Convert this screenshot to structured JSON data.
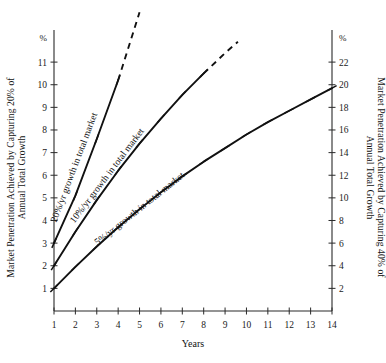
{
  "chart_data": {
    "type": "line",
    "title": "",
    "xlabel": "Years",
    "ylabel": "Market Penetration Achieved by Capturing 20% of Annual Total Growth",
    "ylabel_right": "Market Penetration Achieved by Capturing 40% of Annual Total Growth",
    "y_unit_symbol": "%",
    "x": [
      1,
      2,
      3,
      4,
      5,
      6,
      7,
      8,
      9,
      10,
      11,
      12,
      13,
      14
    ],
    "xlim": [
      1,
      14
    ],
    "xticks": [
      "1",
      "2",
      "3",
      "4",
      "5",
      "6",
      "7",
      "8",
      "9",
      "10",
      "11",
      "12",
      "13",
      "14"
    ],
    "ylim": [
      0,
      11.8
    ],
    "yticks": [
      "1",
      "2",
      "3",
      "4",
      "5",
      "6",
      "7",
      "8",
      "9",
      "10",
      "11"
    ],
    "ylim_right": [
      0,
      23.6
    ],
    "yticks_right": [
      "2",
      "4",
      "6",
      "8",
      "10",
      "12",
      "14",
      "16",
      "18",
      "20",
      "22"
    ],
    "grid": false,
    "legend_position": "inline-on-curve",
    "series": [
      {
        "name": "20%/yr growth in total market",
        "label": "20%/yr growth in total market",
        "solid_x": [
          1,
          2,
          3,
          4
        ],
        "solid_values": [
          3.0,
          5.1,
          7.6,
          10.2
        ],
        "dashed_x": [
          4,
          5
        ],
        "dashed_values": [
          10.2,
          13.2
        ],
        "markers_x": [
          1,
          2,
          3,
          4
        ],
        "style": "solid-then-dashed"
      },
      {
        "name": "10%/yr growth in total market",
        "label": "10%/yr growth in total market",
        "solid_x": [
          1,
          2,
          3,
          4,
          5,
          6,
          7,
          8
        ],
        "solid_values": [
          2.0,
          3.5,
          4.9,
          6.2,
          7.4,
          8.5,
          9.55,
          10.5
        ],
        "dashed_x": [
          8,
          9,
          9.6
        ],
        "dashed_values": [
          10.5,
          11.4,
          11.9
        ],
        "markers_x": [
          1,
          2,
          3,
          4,
          5,
          6,
          7,
          8
        ],
        "style": "solid-then-dashed"
      },
      {
        "name": "5%/yr growth in total market",
        "label": "5%/yr growth in total market",
        "solid_x": [
          1,
          2,
          3,
          4,
          5,
          6,
          7,
          8,
          9,
          10,
          11,
          12,
          13,
          14
        ],
        "solid_values": [
          1.0,
          1.95,
          2.85,
          3.7,
          4.5,
          5.25,
          5.95,
          6.6,
          7.2,
          7.8,
          8.35,
          8.85,
          9.35,
          9.85
        ],
        "dashed_x": [],
        "dashed_values": [],
        "markers_x": [
          1,
          2,
          3,
          4,
          5,
          6,
          7,
          8,
          9,
          10,
          11,
          12,
          13,
          14
        ],
        "style": "solid"
      }
    ]
  },
  "axes": {
    "left": {
      "unit": "%",
      "title": "Market Penetration Achieved by Capturing 20% of",
      "title_line2": "Annual Total Growth"
    },
    "right": {
      "unit": "%",
      "title": "Market Penetration Achieved by Capturing 40% of",
      "title_line2": "Annual Total Growth"
    },
    "bottom": {
      "title": "Years"
    }
  },
  "colors": {
    "ink": "#111111",
    "axis": "#2a2a2a",
    "background": "#ffffff"
  }
}
